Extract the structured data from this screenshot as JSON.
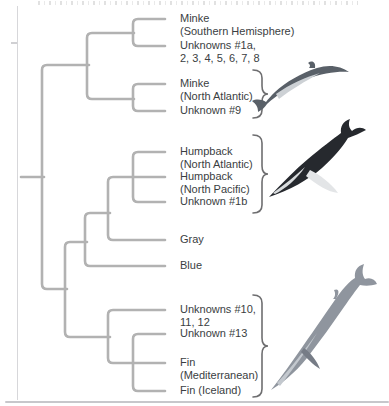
{
  "figure": {
    "kind": "phylogenetic-tree",
    "background": "#ffffff",
    "labels_x": 180
  },
  "taxa": [
    {
      "line1": "Minke",
      "line2": "(Southern Hemisphere)",
      "tick_y": 19
    },
    {
      "line1": "Unknowns #1a,",
      "line2": "2, 3, 4, 5, 6, 7, 8",
      "tick_y": 46
    },
    {
      "line1": "Minke",
      "line2": "(North Atlantic)",
      "tick_y": 84
    },
    {
      "line1": "Unknown #9",
      "line2": "",
      "tick_y": 111
    },
    {
      "line1": "Humpback",
      "line2": "(North Atlantic)",
      "tick_y": 152
    },
    {
      "line1": "Humpback",
      "line2": "(North Pacific)",
      "tick_y": 177
    },
    {
      "line1": "Unknown #1b",
      "line2": "",
      "tick_y": 202
    },
    {
      "line1": "Gray",
      "line2": "",
      "tick_y": 240
    },
    {
      "line1": "Blue",
      "line2": "",
      "tick_y": 266
    },
    {
      "line1": "Unknowns #10,",
      "line2": "11, 12",
      "tick_y": 310
    },
    {
      "line1": "Unknown #13",
      "line2": "",
      "tick_y": 334
    },
    {
      "line1": "Fin",
      "line2": "(Mediterranean)",
      "tick_y": 363
    },
    {
      "line1": "Fin (Iceland)",
      "line2": "",
      "tick_y": 391
    }
  ],
  "tree": {
    "line_color": "#b2b2b2",
    "line_width": 2.6,
    "paths": [
      {
        "id": "root-stem",
        "d": "M21,177 L44,177"
      },
      {
        "id": "main-spine",
        "d": "M89,65 L47,65 Q42,65 42,70 L42,284 Q42,289 47,289 L67,289"
      },
      {
        "id": "minke-superclade",
        "d": "M134,33 L92,33 Q87,33 87,38 L87,94 Q87,99 92,99 L134,99"
      },
      {
        "id": "minke-south-bracket",
        "d": "M165,19 L138,19 Q133,19 133,24 L133,41 Q133,46 138,46 L165,46"
      },
      {
        "id": "minke-na-bracket",
        "d": "M165,84 L138,84 Q133,84 133,89 L133,106 Q133,111 138,111 L165,111"
      },
      {
        "id": "lower-spine",
        "d": "M87,242 L70,242 Q65,242 65,247 L65,332 Q65,337 70,337 L110,337"
      },
      {
        "id": "gray-blue-node",
        "d": "M110,213 L90,213 Q85,213 85,218 L85,261 Q85,266 90,266 L165,266"
      },
      {
        "id": "humpback-gray-node",
        "d": "M165,177 L113,177 Q108,177 108,182 L108,235 Q108,240 113,240 L165,240"
      },
      {
        "id": "humpback-bracket",
        "d": "M165,152 L138,152 Q133,152 133,157 L133,197 Q133,202 138,202 L165,202"
      },
      {
        "id": "fin-clade-node",
        "d": "M165,310 L113,310 Q108,310 108,315 L108,358 Q108,363 113,363 L165,363"
      },
      {
        "id": "fin-bracket",
        "d": "M165,334 L138,334 Q133,334 133,339 L133,386 Q133,391 138,391 L165,391"
      }
    ]
  },
  "braces": {
    "color": "#6e6e70",
    "width": 1.6,
    "items": [
      {
        "group": "minke-na-unknown9-group",
        "y1": 70,
        "y2": 118
      },
      {
        "group": "humpback-group",
        "y1": 135,
        "y2": 213
      },
      {
        "group": "fin-unknowns-group",
        "y1": 295,
        "y2": 397
      }
    ]
  },
  "illustrations": [
    {
      "name": "minke-whale",
      "body_color": "#596068"
    },
    {
      "name": "humpback-whale",
      "body_color": "#26292e"
    },
    {
      "name": "fin-whale",
      "body_color": "#8f959e"
    }
  ]
}
